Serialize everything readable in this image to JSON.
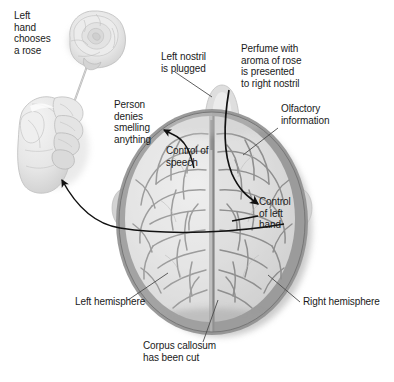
{
  "figure": {
    "background_color": "#ffffff",
    "text_color": "#1a1a1a",
    "line_color": "#111111",
    "brain_fill": "#e2e2e2",
    "brain_shadow": "#8e8e8e",
    "sulci_color": "#a9a9a9",
    "hand_fill": "#e8e8e8",
    "rose_fill": "#e4e4e4"
  },
  "labels": {
    "left_hand_chooses_rose": "Left\nhand\nchooses\na rose",
    "person_denies": "Person\ndenies\nsmelling\nanything",
    "left_nostril_plugged": "Left nostril\nis plugged",
    "perfume_presented": "Perfume with\naroma of rose\nis presented\nto right nostril",
    "olfactory_information": "Olfactory\ninformation",
    "control_of_speech": "Control of\nspeech",
    "control_of_left_hand": "Control\nof left\nhand",
    "left_hemisphere": "Left hemisphere",
    "right_hemisphere": "Right hemisphere",
    "corpus_callosum_cut": "Corpus callosum\nhas been cut"
  },
  "parts": {
    "rose": "rose-flower",
    "stem": "rose-stem",
    "hand": "left-hand",
    "brain": "brain-top-view",
    "nose": "nose",
    "midline": "longitudinal-fissure",
    "corpus_callosum_line": "cut-corpus-callosum"
  },
  "arrows": [
    {
      "name": "arrow-brain-to-hand",
      "from": "right hemisphere",
      "to": "left hand"
    },
    {
      "name": "arrow-speech-to-denies",
      "from": "control of speech",
      "to": "person denies smelling anything"
    },
    {
      "name": "arrow-nostril-to-left-hand-control",
      "from": "right nostril",
      "to": "control of left hand"
    }
  ],
  "leaders": [
    {
      "name": "leader-left-nostril",
      "label": "Left nostril is plugged"
    },
    {
      "name": "leader-olfactory",
      "label": "Olfactory information"
    },
    {
      "name": "leader-left-hemisphere",
      "label": "Left hemisphere"
    },
    {
      "name": "leader-right-hemisphere",
      "label": "Right hemisphere"
    },
    {
      "name": "leader-corpus-callosum",
      "label": "Corpus callosum has been cut"
    },
    {
      "name": "leader-control-left-hand",
      "label": "Control of left hand"
    }
  ]
}
